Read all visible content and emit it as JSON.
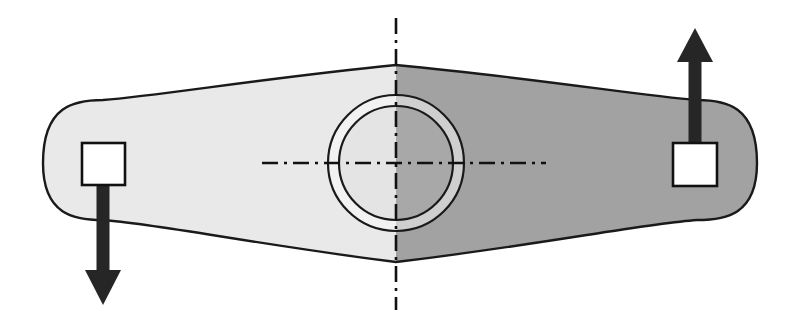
{
  "canvas": {
    "width": 799,
    "height": 328,
    "background": "#ffffff",
    "title": "Rocker link free-body diagram with opposing end forces about a central pivot"
  },
  "palette": {
    "left_half_fill": "#e9e9e9",
    "right_half_fill": "#a2a2a2",
    "outline_stroke": "#1a1a1a",
    "hub_ring_fill": "#f2f2f2",
    "hub_bore_left_fill": "#e4e4e4",
    "hub_bore_right_fill": "#a8a8a8",
    "centerline_stroke": "#111111",
    "arrow_fill": "#262626",
    "pad_fill": "#ffffff",
    "pad_stroke": "#111111"
  },
  "body": {
    "name": "link-body",
    "description": "Symmetric two-lobe link, rounded ends, waisted toward the pivot",
    "left_cap_center_x": 103,
    "right_cap_center_x": 697,
    "cap_radius_y": 59,
    "left_extent_x": 43,
    "right_extent_x": 757,
    "top_edge_at_center_y": 65,
    "bottom_edge_at_center_y": 262,
    "top_edge_at_lobe_y": 100,
    "bottom_edge_at_lobe_y": 220,
    "outline_width": 2.4,
    "split_x": 396
  },
  "hub": {
    "name": "central-pivot-hub",
    "center_x": 396,
    "center_y": 163,
    "outer_radius": 68,
    "inner_radius": 57,
    "ring_label": "bearing boss",
    "bore_label": "pivot bore",
    "stroke_width": 2.2
  },
  "centerlines": {
    "vertical": {
      "name": "vertical-centerline",
      "x": 396,
      "y_start": 18,
      "y_end": 310,
      "pattern": "dash-dot",
      "dash_array": "16 6 3 6",
      "width": 2.6
    },
    "horizontal": {
      "name": "horizontal-centerline",
      "y": 163,
      "x_start": 262,
      "x_end": 546,
      "pattern": "dash-dot",
      "dash_array": "16 6 3 6",
      "width": 2.6
    }
  },
  "loads": [
    {
      "id": "left-load",
      "name": "left-force-arrow",
      "direction": "down",
      "pad": {
        "x": 82,
        "y": 143,
        "width": 43,
        "height": 42
      },
      "shaft": {
        "x": 103,
        "y_start": 185,
        "y_end": 278,
        "width": 13
      },
      "head": {
        "tip_y": 305,
        "base_y": 270,
        "half_width": 18
      },
      "label": "F",
      "sense": "downward reaction at left end"
    },
    {
      "id": "right-load",
      "name": "right-force-arrow",
      "direction": "up",
      "pad": {
        "x": 673,
        "y": 143,
        "width": 44,
        "height": 43
      },
      "shaft": {
        "x": 695,
        "y_start": 143,
        "y_end": 55,
        "width": 13
      },
      "head": {
        "tip_y": 28,
        "base_y": 62,
        "half_width": 18
      },
      "label": "F",
      "sense": "upward applied load at right end"
    }
  ]
}
